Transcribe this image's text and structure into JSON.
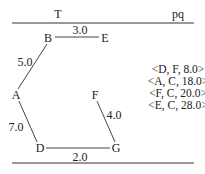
{
  "headers": {
    "left": "T",
    "right": "pq"
  },
  "graph": {
    "nodes": [
      {
        "id": "B",
        "x": 48,
        "y": 38
      },
      {
        "id": "E",
        "x": 105,
        "y": 38
      },
      {
        "id": "A",
        "x": 16,
        "y": 95
      },
      {
        "id": "F",
        "x": 95,
        "y": 95
      },
      {
        "id": "D",
        "x": 40,
        "y": 148
      },
      {
        "id": "G",
        "x": 116,
        "y": 148
      }
    ],
    "edges": [
      {
        "from": "B",
        "to": "E",
        "weight": "3.0"
      },
      {
        "from": "B",
        "to": "A",
        "weight": "5.0"
      },
      {
        "from": "A",
        "to": "D",
        "weight": "7.0"
      },
      {
        "from": "D",
        "to": "G",
        "weight": "2.0"
      },
      {
        "from": "F",
        "to": "G",
        "weight": "4.0"
      }
    ]
  },
  "pq": [
    "<D, F, 8.0>",
    "<A, C, 18.0>",
    "<F, C, 20.0>",
    "<E, C, 28.0>"
  ]
}
